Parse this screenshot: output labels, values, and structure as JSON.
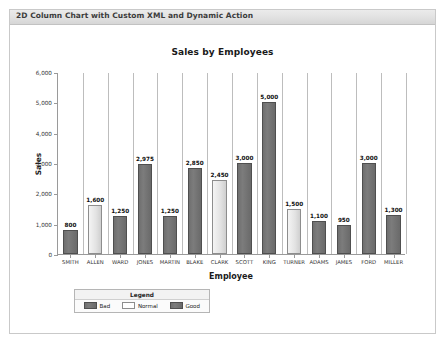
{
  "region": {
    "title": "2D Column Chart with Custom XML and Dynamic Action"
  },
  "chart_data": {
    "type": "bar",
    "title": "Sales by Employees",
    "xlabel": "Employee",
    "ylabel": "Sales",
    "ylim": [
      0,
      6000
    ],
    "yticks": [
      "0",
      "1,000",
      "2,000",
      "3,000",
      "4,000",
      "5,000",
      "6,000"
    ],
    "ytick_values": [
      0,
      1000,
      2000,
      3000,
      4000,
      5000,
      6000
    ],
    "grid": "vertical-category-separators",
    "legend_position": "bottom-left",
    "categories": [
      "SMITH",
      "ALLEN",
      "WARD",
      "JONES",
      "MARTIN",
      "BLAKE",
      "CLARK",
      "SCOTT",
      "KING",
      "TURNER",
      "ADAMS",
      "JAMES",
      "FORD",
      "MILLER"
    ],
    "values": [
      800,
      1600,
      1250,
      2975,
      1250,
      2850,
      2450,
      3000,
      5000,
      1500,
      1100,
      950,
      3000,
      1300
    ],
    "value_labels": [
      "800",
      "1,600",
      "1,250",
      "2,975",
      "1,250",
      "2,850",
      "2,450",
      "3,000",
      "5,000",
      "1,500",
      "1,100",
      "950",
      "3,000",
      "1,300"
    ],
    "point_styles": [
      "dark",
      "light",
      "dark",
      "dark",
      "dark",
      "dark",
      "light",
      "dark",
      "dark",
      "light",
      "dark",
      "dark",
      "dark",
      "dark"
    ],
    "legend": {
      "title": "Legend",
      "entries": [
        {
          "label": "Bad",
          "style": "dark"
        },
        {
          "label": "Normal",
          "style": "light"
        },
        {
          "label": "Good",
          "style": "dark"
        }
      ]
    },
    "colors": {
      "bar_dark": "#757575",
      "bar_light": "#ebebeb",
      "axis": "#9a9a9a",
      "gridline": "#bdbdbd",
      "text": "#1a1a1a"
    }
  }
}
